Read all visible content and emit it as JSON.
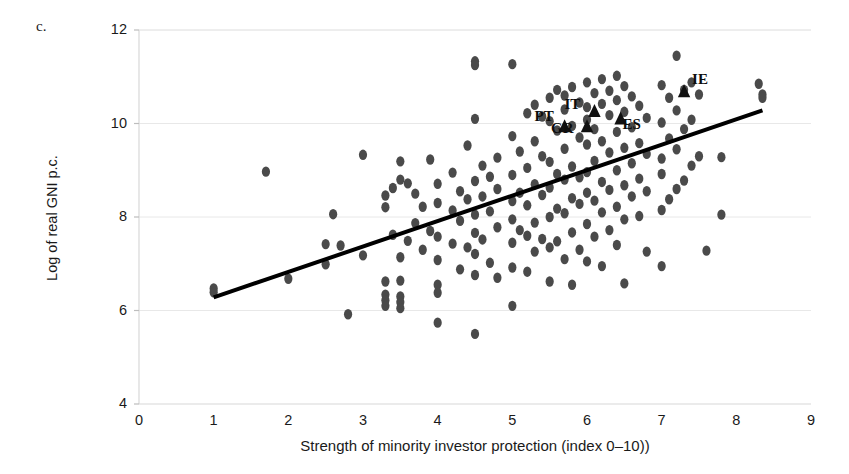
{
  "figure": {
    "panel_label": "c.",
    "background_color": "#ffffff"
  },
  "chart_data": {
    "type": "scatter",
    "title": "",
    "panel": "c.",
    "xlabel": "Strength of minority investor protection (index 0–10))",
    "ylabel": "Log of real GNI p.c.",
    "xlim": [
      0,
      9
    ],
    "ylim": [
      4,
      12
    ],
    "xticks": [
      0,
      1,
      2,
      3,
      4,
      5,
      6,
      7,
      8,
      9
    ],
    "yticks": [
      4,
      6,
      8,
      10,
      12
    ],
    "grid": "horizontal",
    "grid_color": "#e8e8e8",
    "legend": "none",
    "point_color": "#4a4a4a",
    "point_shape": "ellipse",
    "highlight_color": "#111111",
    "highlight_shape": "triangle",
    "trendline": {
      "type": "linear",
      "color": "#000000",
      "width": 4,
      "x_start": 1.0,
      "y_start": 6.28,
      "x_end": 8.35,
      "y_end": 10.28
    },
    "series": [
      {
        "name": "Countries",
        "points": [
          [
            1.0,
            6.47
          ],
          [
            1.0,
            6.39
          ],
          [
            1.7,
            8.97
          ],
          [
            2.0,
            6.68
          ],
          [
            2.5,
            7.42
          ],
          [
            2.5,
            6.99
          ],
          [
            2.6,
            8.06
          ],
          [
            2.7,
            7.39
          ],
          [
            2.8,
            5.92
          ],
          [
            3.0,
            9.33
          ],
          [
            3.0,
            7.18
          ],
          [
            3.3,
            8.46
          ],
          [
            3.3,
            8.21
          ],
          [
            3.3,
            6.62
          ],
          [
            3.3,
            6.34
          ],
          [
            3.3,
            6.22
          ],
          [
            3.3,
            6.1
          ],
          [
            3.4,
            8.62
          ],
          [
            3.4,
            7.62
          ],
          [
            3.5,
            9.19
          ],
          [
            3.5,
            8.8
          ],
          [
            3.5,
            7.14
          ],
          [
            3.5,
            6.64
          ],
          [
            3.5,
            6.3
          ],
          [
            3.5,
            6.18
          ],
          [
            3.5,
            6.05
          ],
          [
            3.6,
            8.72
          ],
          [
            3.6,
            7.49
          ],
          [
            3.7,
            8.5
          ],
          [
            3.7,
            7.87
          ],
          [
            3.8,
            8.22
          ],
          [
            3.8,
            7.3
          ],
          [
            3.9,
            9.23
          ],
          [
            3.9,
            7.7
          ],
          [
            4.0,
            8.71
          ],
          [
            4.0,
            8.3
          ],
          [
            4.0,
            7.58
          ],
          [
            4.0,
            7.08
          ],
          [
            4.0,
            6.55
          ],
          [
            4.0,
            6.38
          ],
          [
            4.0,
            5.74
          ],
          [
            4.2,
            8.95
          ],
          [
            4.2,
            8.14
          ],
          [
            4.2,
            7.43
          ],
          [
            4.3,
            8.55
          ],
          [
            4.3,
            7.92
          ],
          [
            4.3,
            6.88
          ],
          [
            4.4,
            9.53
          ],
          [
            4.4,
            8.38
          ],
          [
            4.4,
            7.35
          ],
          [
            4.5,
            11.33
          ],
          [
            4.5,
            11.25
          ],
          [
            4.5,
            10.1
          ],
          [
            4.5,
            8.77
          ],
          [
            4.5,
            8.05
          ],
          [
            4.5,
            7.66
          ],
          [
            4.5,
            7.21
          ],
          [
            4.5,
            6.76
          ],
          [
            4.5,
            5.5
          ],
          [
            4.6,
            9.1
          ],
          [
            4.6,
            8.44
          ],
          [
            4.6,
            7.52
          ],
          [
            4.7,
            8.86
          ],
          [
            4.7,
            8.12
          ],
          [
            4.7,
            7.02
          ],
          [
            4.8,
            9.27
          ],
          [
            4.8,
            8.6
          ],
          [
            4.8,
            7.78
          ],
          [
            4.8,
            6.7
          ],
          [
            5.0,
            11.27
          ],
          [
            5.0,
            9.73
          ],
          [
            5.0,
            8.9
          ],
          [
            5.0,
            8.34
          ],
          [
            5.0,
            7.95
          ],
          [
            5.0,
            7.45
          ],
          [
            5.0,
            6.92
          ],
          [
            5.0,
            6.1
          ],
          [
            5.1,
            9.4
          ],
          [
            5.1,
            8.52
          ],
          [
            5.1,
            7.72
          ],
          [
            5.2,
            10.22
          ],
          [
            5.2,
            9.05
          ],
          [
            5.2,
            8.25
          ],
          [
            5.2,
            7.6
          ],
          [
            5.2,
            6.83
          ],
          [
            5.3,
            10.4
          ],
          [
            5.3,
            9.62
          ],
          [
            5.3,
            8.7
          ],
          [
            5.3,
            7.88
          ],
          [
            5.3,
            7.26
          ],
          [
            5.4,
            10.15
          ],
          [
            5.4,
            9.3
          ],
          [
            5.4,
            8.47
          ],
          [
            5.4,
            7.53
          ],
          [
            5.5,
            10.55
          ],
          [
            5.5,
            10.05
          ],
          [
            5.5,
            9.18
          ],
          [
            5.5,
            8.63
          ],
          [
            5.5,
            8.0
          ],
          [
            5.5,
            7.35
          ],
          [
            5.5,
            6.62
          ],
          [
            5.6,
            10.72
          ],
          [
            5.6,
            9.85
          ],
          [
            5.6,
            8.92
          ],
          [
            5.6,
            8.18
          ],
          [
            5.6,
            7.48
          ],
          [
            5.7,
            10.6
          ],
          [
            5.7,
            10.3
          ],
          [
            5.7,
            9.46
          ],
          [
            5.7,
            8.8
          ],
          [
            5.7,
            8.08
          ],
          [
            5.7,
            7.1
          ],
          [
            5.8,
            10.78
          ],
          [
            5.8,
            9.95
          ],
          [
            5.8,
            9.08
          ],
          [
            5.8,
            8.4
          ],
          [
            5.8,
            7.67
          ],
          [
            5.8,
            6.55
          ],
          [
            5.9,
            10.45
          ],
          [
            5.9,
            9.7
          ],
          [
            5.9,
            8.85
          ],
          [
            5.9,
            8.28
          ],
          [
            5.9,
            7.3
          ],
          [
            6.0,
            10.88
          ],
          [
            6.0,
            10.35
          ],
          [
            6.0,
            10.08
          ],
          [
            6.0,
            9.55
          ],
          [
            6.0,
            8.96
          ],
          [
            6.0,
            8.52
          ],
          [
            6.0,
            7.85
          ],
          [
            6.0,
            7.05
          ],
          [
            6.1,
            10.65
          ],
          [
            6.1,
            9.88
          ],
          [
            6.1,
            9.2
          ],
          [
            6.1,
            8.35
          ],
          [
            6.1,
            7.58
          ],
          [
            6.2,
            10.95
          ],
          [
            6.2,
            10.42
          ],
          [
            6.2,
            9.62
          ],
          [
            6.2,
            8.75
          ],
          [
            6.2,
            8.1
          ],
          [
            6.2,
            6.95
          ],
          [
            6.3,
            10.7
          ],
          [
            6.3,
            10.18
          ],
          [
            6.3,
            9.38
          ],
          [
            6.3,
            8.58
          ],
          [
            6.3,
            7.72
          ],
          [
            6.4,
            11.02
          ],
          [
            6.4,
            10.5
          ],
          [
            6.4,
            9.82
          ],
          [
            6.4,
            9.0
          ],
          [
            6.4,
            8.22
          ],
          [
            6.4,
            7.4
          ],
          [
            6.5,
            10.8
          ],
          [
            6.5,
            10.25
          ],
          [
            6.5,
            9.48
          ],
          [
            6.5,
            8.68
          ],
          [
            6.5,
            7.95
          ],
          [
            6.5,
            6.58
          ],
          [
            6.6,
            10.58
          ],
          [
            6.6,
            9.92
          ],
          [
            6.6,
            9.15
          ],
          [
            6.6,
            8.44
          ],
          [
            6.7,
            10.38
          ],
          [
            6.7,
            9.58
          ],
          [
            6.7,
            8.82
          ],
          [
            6.7,
            8.02
          ],
          [
            6.8,
            10.12
          ],
          [
            6.8,
            9.35
          ],
          [
            6.8,
            8.55
          ],
          [
            6.8,
            7.26
          ],
          [
            7.0,
            10.82
          ],
          [
            7.0,
            10.02
          ],
          [
            7.0,
            9.25
          ],
          [
            7.0,
            8.92
          ],
          [
            7.0,
            8.15
          ],
          [
            7.0,
            6.95
          ],
          [
            7.1,
            10.55
          ],
          [
            7.1,
            9.68
          ],
          [
            7.1,
            8.38
          ],
          [
            7.2,
            11.45
          ],
          [
            7.2,
            10.28
          ],
          [
            7.2,
            9.45
          ],
          [
            7.2,
            8.6
          ],
          [
            7.3,
            10.72
          ],
          [
            7.3,
            9.88
          ],
          [
            7.3,
            8.78
          ],
          [
            7.4,
            10.88
          ],
          [
            7.4,
            10.08
          ],
          [
            7.4,
            9.1
          ],
          [
            7.5,
            10.62
          ],
          [
            7.5,
            9.3
          ],
          [
            7.6,
            7.28
          ],
          [
            7.8,
            9.28
          ],
          [
            7.8,
            8.05
          ],
          [
            8.3,
            10.85
          ],
          [
            8.35,
            10.62
          ],
          [
            8.35,
            10.55
          ]
        ]
      }
    ],
    "highlighted_points": [
      {
        "code": "PT",
        "x": 5.7,
        "y": 9.95,
        "label_dx": -30,
        "label_dy": -10
      },
      {
        "code": "GR",
        "x": 6.0,
        "y": 9.95,
        "label_dx": -36,
        "label_dy": 2
      },
      {
        "code": "IT",
        "x": 6.1,
        "y": 10.28,
        "label_dx": -30,
        "label_dy": -6
      },
      {
        "code": "ES",
        "x": 6.45,
        "y": 10.12,
        "label_dx": 2,
        "label_dy": 6
      },
      {
        "code": "IE",
        "x": 7.3,
        "y": 10.7,
        "label_dx": 8,
        "label_dy": -12
      }
    ]
  },
  "axes": {
    "y_tick_labels": [
      "12",
      "10",
      "8",
      "6",
      "4"
    ],
    "x_tick_labels": [
      "0",
      "1",
      "2",
      "3",
      "4",
      "5",
      "6",
      "7",
      "8",
      "9"
    ],
    "y_title": "Log of real GNI p.c.",
    "x_title": "Strength of minority investor protection (index 0–10))"
  }
}
